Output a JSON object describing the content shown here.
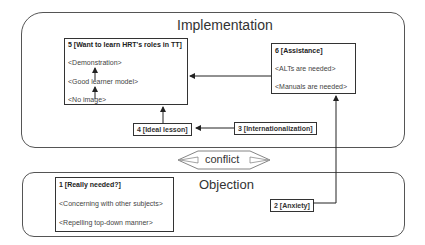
{
  "regions": {
    "implementation": {
      "title": "Implementation"
    },
    "objection": {
      "title": "Objection"
    }
  },
  "nodes": {
    "n5": {
      "title": "5 [Want to learn HRT's roles in TT]",
      "items": [
        "<Demonstration>",
        "<Good learner model>",
        "<No image>"
      ]
    },
    "n6": {
      "title": "6 [Assistance]",
      "items": [
        "<ALTs are needed>",
        "<Manuals are needed>"
      ]
    },
    "n4": {
      "title": "4 [Ideal lesson]"
    },
    "n3": {
      "title": "3 [Internationalization]"
    },
    "n1": {
      "title": "1 [Really needed?]",
      "items": [
        "<Concerning with other subjects>",
        "<Repelling top-down manner>"
      ]
    },
    "n2": {
      "title": "2 [Anxiety]"
    }
  },
  "conflict": {
    "label": "conflict"
  },
  "colors": {
    "stroke": "#333333",
    "region_stroke": "#555555",
    "text": "#333333"
  }
}
